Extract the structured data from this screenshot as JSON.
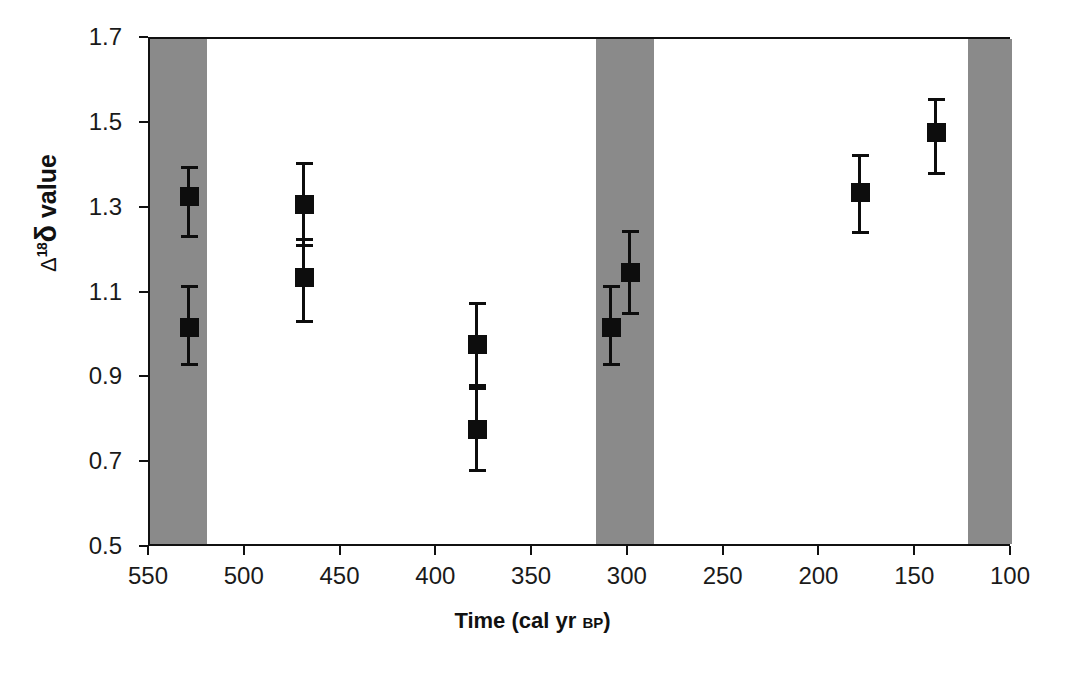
{
  "chart_data": {
    "type": "scatter",
    "title": "",
    "xlabel": "Time (cal yr BP)",
    "xlabel_main": "Time (cal yr ",
    "xlabel_smallcaps": "BP",
    "xlabel_close": ")",
    "ylabel": "Δ¹⁸δ value",
    "ylabel_parts": {
      "delta_cap": "Δ",
      "superscript": "18",
      "delta_low": "δ",
      "word": " value"
    },
    "xlim": [
      550,
      100
    ],
    "ylim": [
      0.5,
      1.7
    ],
    "x_inverted": true,
    "grid": false,
    "legend": "none",
    "xticks": [
      550,
      500,
      450,
      400,
      350,
      300,
      250,
      200,
      150,
      100
    ],
    "xtick_labels": [
      "550",
      "500",
      "450",
      "400",
      "350",
      "300",
      "250",
      "200",
      "150",
      "100"
    ],
    "yticks": [
      0.5,
      0.7,
      0.9,
      1.1,
      1.3,
      1.5,
      1.7
    ],
    "ytick_labels": [
      "0.5",
      "0.7",
      "0.9",
      "1.1",
      "1.3",
      "1.5",
      "1.7"
    ],
    "marker_style": "filled-square",
    "marker_color": "#0d0d0d",
    "error_bar_style": "capped-vertical",
    "points": [
      {
        "x": 530,
        "y": 1.33,
        "yerr_low": 1.23,
        "yerr_high": 1.4
      },
      {
        "x": 530,
        "y": 1.02,
        "yerr_low": 0.93,
        "yerr_high": 1.12
      },
      {
        "x": 470,
        "y": 1.31,
        "yerr_low": 1.21,
        "yerr_high": 1.41
      },
      {
        "x": 470,
        "y": 1.14,
        "yerr_low": 1.03,
        "yerr_high": 1.23
      },
      {
        "x": 380,
        "y": 0.98,
        "yerr_low": 0.88,
        "yerr_high": 1.08
      },
      {
        "x": 380,
        "y": 0.78,
        "yerr_low": 0.68,
        "yerr_high": 0.88
      },
      {
        "x": 310,
        "y": 1.02,
        "yerr_low": 0.93,
        "yerr_high": 1.12
      },
      {
        "x": 300,
        "y": 1.15,
        "yerr_low": 1.05,
        "yerr_high": 1.25
      },
      {
        "x": 180,
        "y": 1.34,
        "yerr_low": 1.24,
        "yerr_high": 1.43
      },
      {
        "x": 140,
        "y": 1.48,
        "yerr_low": 1.38,
        "yerr_high": 1.56
      }
    ],
    "shaded_bands": [
      {
        "name": "band-left",
        "x_start": 550,
        "x_end": 520,
        "color": "#8a8a8a"
      },
      {
        "name": "band-middle",
        "x_start": 317,
        "x_end": 287,
        "color": "#8a8a8a"
      },
      {
        "name": "band-right",
        "x_start": 123,
        "x_end": 100,
        "color": "#8a8a8a"
      }
    ],
    "colors": {
      "band_fill": "#8a8a8a",
      "axis": "#111111",
      "marker": "#0d0d0d",
      "background": "#ffffff"
    }
  }
}
